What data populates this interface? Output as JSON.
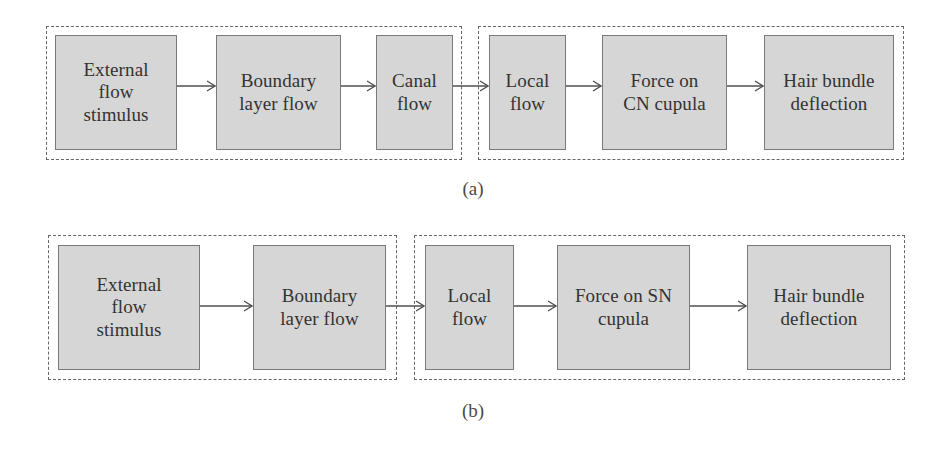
{
  "figure": {
    "type": "block-flow-diagram",
    "panels": [
      {
        "caption": "(a)",
        "caption_x": 443,
        "caption_y": 178,
        "groups": [
          {
            "name": "external-stage-group",
            "x": 46,
            "y": 26,
            "w": 416,
            "h": 134
          },
          {
            "name": "local-stage-group",
            "x": 478,
            "y": 26,
            "w": 426,
            "h": 134
          }
        ],
        "boxes": [
          {
            "label": "External\nflow\nstimulus",
            "x": 55,
            "y": 35,
            "w": 122,
            "h": 115
          },
          {
            "label": "Boundary\nlayer flow",
            "x": 216,
            "y": 35,
            "w": 125,
            "h": 115
          },
          {
            "label": "Canal\nflow",
            "x": 376,
            "y": 35,
            "w": 77,
            "h": 115
          },
          {
            "label": "Local\nflow",
            "x": 489,
            "y": 35,
            "w": 77,
            "h": 115
          },
          {
            "label": "Force on\nCN cupula",
            "x": 602,
            "y": 35,
            "w": 125,
            "h": 115
          },
          {
            "label": "Hair bundle\ndeflection",
            "x": 764,
            "y": 35,
            "w": 130,
            "h": 115
          }
        ],
        "arrows": [
          {
            "x": 177,
            "y": 86,
            "w": 39
          },
          {
            "x": 341,
            "y": 86,
            "w": 35
          },
          {
            "x": 453,
            "y": 86,
            "w": 36
          },
          {
            "x": 566,
            "y": 86,
            "w": 36
          },
          {
            "x": 727,
            "y": 86,
            "w": 37
          }
        ]
      },
      {
        "caption": "(b)",
        "caption_x": 443,
        "caption_y": 400,
        "groups": [
          {
            "name": "external-stage-group",
            "x": 48,
            "y": 235,
            "w": 349,
            "h": 145
          },
          {
            "name": "local-stage-group",
            "x": 414,
            "y": 235,
            "w": 491,
            "h": 145
          }
        ],
        "boxes": [
          {
            "label": "External\nflow\nstimulus",
            "x": 58,
            "y": 245,
            "w": 142,
            "h": 125
          },
          {
            "label": "Boundary\nlayer flow",
            "x": 253,
            "y": 245,
            "w": 133,
            "h": 125
          },
          {
            "label": "Local\nflow",
            "x": 425,
            "y": 245,
            "w": 89,
            "h": 125
          },
          {
            "label": "Force on SN\ncupula",
            "x": 557,
            "y": 245,
            "w": 133,
            "h": 125
          },
          {
            "label": "Hair bundle\ndeflection",
            "x": 747,
            "y": 245,
            "w": 144,
            "h": 125
          }
        ],
        "arrows": [
          {
            "x": 200,
            "y": 306,
            "w": 53
          },
          {
            "x": 386,
            "y": 306,
            "w": 39
          },
          {
            "x": 514,
            "y": 306,
            "w": 43
          },
          {
            "x": 690,
            "y": 306,
            "w": 57
          }
        ]
      }
    ],
    "colors": {
      "box_fill": "#d6d6d6",
      "box_border": "#7a7a7a",
      "dashed_border": "#666666",
      "text": "#333333",
      "arrow": "#4f4f4f",
      "background": "#ffffff"
    }
  }
}
